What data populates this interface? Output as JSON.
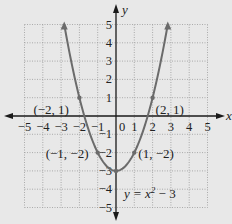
{
  "chart_data": {
    "type": "line",
    "title": "",
    "equation": "y = x² − 3",
    "equation_parts": {
      "lhs": "y = x",
      "exp": "2",
      "rhs": " − 3"
    },
    "xlabel": "x",
    "ylabel": "y",
    "xlim": [
      -5,
      5
    ],
    "ylim": [
      -5,
      5
    ],
    "grid": true,
    "x_ticks": [
      "−5",
      "−4",
      "−3",
      "−2",
      "−1",
      "1",
      "2",
      "3",
      "4",
      "5"
    ],
    "x_tick_values": [
      -5,
      -4,
      -3,
      -2,
      -1,
      1,
      2,
      3,
      4,
      5
    ],
    "y_ticks": [
      "5",
      "4",
      "3",
      "2",
      "1",
      "−1",
      "−2",
      "−3",
      "−4",
      "−5"
    ],
    "y_tick_values": [
      5,
      4,
      3,
      2,
      1,
      -1,
      -2,
      -3,
      -4,
      -5
    ],
    "origin_label": "0",
    "series": [
      {
        "name": "y = x^2 - 3",
        "x": [
          -2.83,
          -2,
          -1,
          0,
          1,
          2,
          2.83
        ],
        "y": [
          5,
          1,
          -2,
          -3,
          -2,
          1,
          5
        ]
      }
    ],
    "points": [
      {
        "x": -2,
        "y": 1,
        "label": "(−2, 1)"
      },
      {
        "x": 2,
        "y": 1,
        "label": "(2, 1)"
      },
      {
        "x": -1,
        "y": -2,
        "label": "(−1, −2)"
      },
      {
        "x": 1,
        "y": -2,
        "label": "(1, −2)"
      },
      {
        "x": 0,
        "y": -3,
        "label": ""
      }
    ],
    "colors": {
      "background": "#e8e8e8",
      "curve": "#6b6b6b",
      "axes": "#1a1a1a",
      "grid": "#9a9a9a"
    }
  }
}
